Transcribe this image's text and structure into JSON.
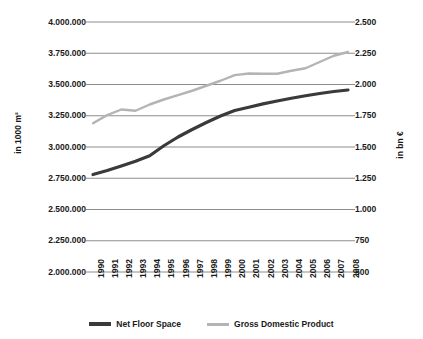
{
  "chart_data": {
    "type": "line",
    "title": "",
    "xlabel": "",
    "categories": [
      "1990",
      "1991",
      "1992",
      "1993",
      "1994",
      "1995",
      "1996",
      "1997",
      "1998",
      "1999",
      "2000",
      "2001",
      "2002",
      "2003",
      "2004",
      "2005",
      "2006",
      "2007",
      "2008"
    ],
    "grid": true,
    "legend_position": "bottom",
    "axes": {
      "left": {
        "label": "in 1000 m²",
        "min": 2000000,
        "max": 4000000,
        "step": 250000,
        "ticks": [
          "2.000.000",
          "2.250.000",
          "2.500.000",
          "2.750.000",
          "3.000.000",
          "3.250.000",
          "3.500.000",
          "3.750.000",
          "4.000.000"
        ],
        "tick_values": [
          2000000,
          2250000,
          2500000,
          2750000,
          3000000,
          3250000,
          3500000,
          3750000,
          4000000
        ]
      },
      "right": {
        "label": "in bn €",
        "min": 500,
        "max": 2500,
        "step": 250,
        "ticks": [
          "500",
          "750",
          "1.000",
          "1.250",
          "1.500",
          "1.750",
          "2.000",
          "2.250",
          "2.500"
        ],
        "tick_values": [
          500,
          750,
          1000,
          1250,
          1500,
          1750,
          2000,
          2250,
          2500
        ]
      }
    },
    "series": [
      {
        "name": "Net Floor Space",
        "axis": "left",
        "color": "#3a3a3a",
        "width": 3.2,
        "values": [
          2780000,
          2812000,
          2848000,
          2886000,
          2930000,
          3010000,
          3080000,
          3140000,
          3196000,
          3248000,
          3292000,
          3318000,
          3345000,
          3368000,
          3390000,
          3410000,
          3428000,
          3444000,
          3456000
        ]
      },
      {
        "name": "Gross Domestic Product",
        "axis": "right",
        "color": "#b4b4b4",
        "width": 2.4,
        "values": [
          1690,
          1755,
          1800,
          1790,
          1840,
          1880,
          1915,
          1950,
          1990,
          2030,
          2075,
          2088,
          2086,
          2086,
          2110,
          2130,
          2180,
          2230,
          2260
        ]
      }
    ]
  },
  "legend": {
    "items": [
      {
        "label": "Net Floor Space",
        "color": "#3a3a3a",
        "style": "thick"
      },
      {
        "label": "Gross Domestic Product",
        "color": "#b4b4b4",
        "style": "thin"
      }
    ]
  }
}
